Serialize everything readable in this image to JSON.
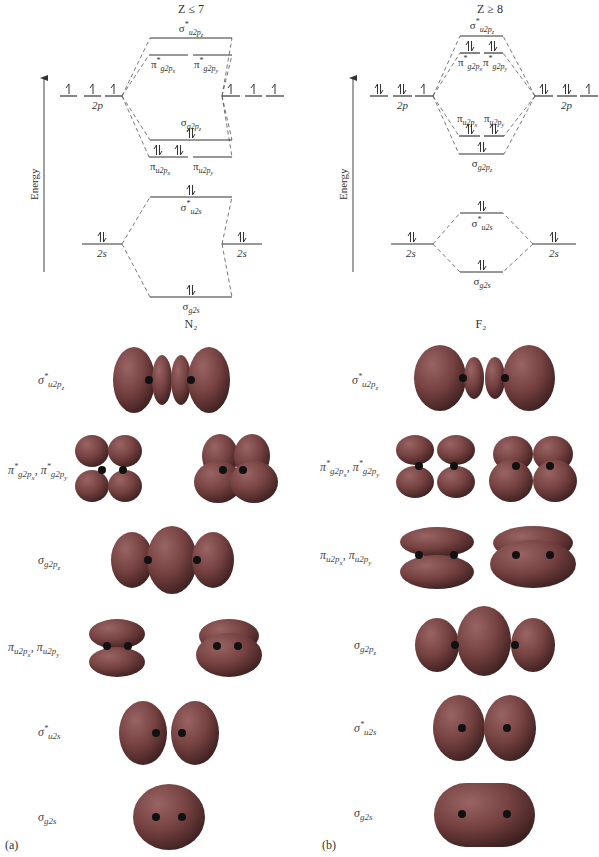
{
  "panels": [
    {
      "id": "a",
      "tag": "(a)",
      "condition": "Z ≤ 7",
      "molecule": "N₂",
      "axis_label": "Energy",
      "mo_levels": [
        {
          "name": "σ*u2pz",
          "sym": "σ",
          "star": true,
          "sub": "u2p",
          "subsub": "z",
          "electrons": 0
        },
        {
          "name": "π*g2px",
          "sym": "π",
          "star": true,
          "sub": "g2p",
          "subsub": "x",
          "electrons": 0
        },
        {
          "name": "π*g2py",
          "sym": "π",
          "star": true,
          "sub": "g2p",
          "subsub": "y",
          "electrons": 0
        },
        {
          "name": "σg2pz",
          "sym": "σ",
          "star": false,
          "sub": "g2p",
          "subsub": "z",
          "electrons": 2
        },
        {
          "name": "πu2px",
          "sym": "π",
          "star": false,
          "sub": "u2p",
          "subsub": "x",
          "electrons": 2
        },
        {
          "name": "πu2py",
          "sym": "π",
          "star": false,
          "sub": "u2p",
          "subsub": "y",
          "electrons": 2
        },
        {
          "name": "σ*u2s",
          "sym": "σ",
          "star": true,
          "sub": "u2s",
          "subsub": "",
          "electrons": 2
        },
        {
          "name": "σg2s",
          "sym": "σ",
          "star": false,
          "sub": "g2s",
          "subsub": "",
          "electrons": 2
        }
      ],
      "atomic_levels": {
        "2p_label": "2p",
        "2s_label": "2s",
        "left_2p_electrons": [
          1,
          1,
          1
        ],
        "right_2p_electrons": [
          1,
          1,
          1
        ],
        "left_2s_electrons": 2,
        "right_2s_electrons": 2
      },
      "orbital_rows": [
        {
          "label_sym": "σ",
          "label_star": "*",
          "label_sub": "u2p",
          "label_subsub": "z",
          "text": "σ*u2pz"
        },
        {
          "label_sym": "π",
          "label_star": "*",
          "label_sub": "g2p",
          "label_subsub": "x",
          "text": "π*g2px, π*g2py"
        },
        {
          "label_sym": "σ",
          "label_star": "",
          "label_sub": "g2p",
          "label_subsub": "z",
          "text": "σg2pz"
        },
        {
          "label_sym": "π",
          "label_star": "",
          "label_sub": "u2p",
          "label_subsub": "x",
          "text": "πu2px, πu2py"
        },
        {
          "label_sym": "σ",
          "label_star": "*",
          "label_sub": "u2s",
          "label_subsub": "",
          "text": "σ*u2s"
        },
        {
          "label_sym": "σ",
          "label_star": "",
          "label_sub": "g2s",
          "label_subsub": "",
          "text": "σg2s"
        }
      ]
    },
    {
      "id": "b",
      "tag": "(b)",
      "condition": "Z ≥ 8",
      "molecule": "F₂",
      "axis_label": "Energy",
      "mo_levels": [
        {
          "name": "σ*u2pz",
          "sym": "σ",
          "star": true,
          "sub": "u2p",
          "subsub": "z",
          "electrons": 0
        },
        {
          "name": "π*g2px",
          "sym": "π",
          "star": true,
          "sub": "g2p",
          "subsub": "x",
          "electrons": 2
        },
        {
          "name": "π*g2py",
          "sym": "π",
          "star": true,
          "sub": "g2p",
          "subsub": "y",
          "electrons": 2
        },
        {
          "name": "πu2px",
          "sym": "π",
          "star": false,
          "sub": "u2p",
          "subsub": "x",
          "electrons": 2
        },
        {
          "name": "πu2py",
          "sym": "π",
          "star": false,
          "sub": "u2p",
          "subsub": "y",
          "electrons": 2
        },
        {
          "name": "σg2pz",
          "sym": "σ",
          "star": false,
          "sub": "g2p",
          "subsub": "z",
          "electrons": 2
        },
        {
          "name": "σ*u2s",
          "sym": "σ",
          "star": true,
          "sub": "u2s",
          "subsub": "",
          "electrons": 2
        },
        {
          "name": "σg2s",
          "sym": "σ",
          "star": false,
          "sub": "g2s",
          "subsub": "",
          "electrons": 2
        }
      ],
      "atomic_levels": {
        "2p_label": "2p",
        "2s_label": "2s",
        "left_2p_electrons": [
          2,
          2,
          1
        ],
        "right_2p_electrons": [
          2,
          2,
          1
        ],
        "left_2s_electrons": 2,
        "right_2s_electrons": 2
      },
      "orbital_rows": [
        {
          "label_sym": "σ",
          "label_star": "*",
          "label_sub": "u2p",
          "label_subsub": "z",
          "text": "σ*u2pz"
        },
        {
          "label_sym": "π",
          "label_star": "*",
          "label_sub": "g2p",
          "label_subsub": "x",
          "text": "π*g2px, π*g2py"
        },
        {
          "label_sym": "π",
          "label_star": "",
          "label_sub": "u2p",
          "label_subsub": "x",
          "text": "πu2px, πu2py"
        },
        {
          "label_sym": "σ",
          "label_star": "",
          "label_sub": "g2p",
          "label_subsub": "z",
          "text": "σg2pz"
        },
        {
          "label_sym": "σ",
          "label_star": "*",
          "label_sub": "u2s",
          "label_subsub": "",
          "text": "σ*u2s"
        },
        {
          "label_sym": "σ",
          "label_star": "",
          "label_sub": "g2s",
          "label_subsub": "",
          "text": "σg2s"
        }
      ]
    }
  ],
  "colors": {
    "orbital_fill": "#7a4545",
    "orbital_highlight": "#9a6a6a",
    "orbital_shadow": "#3d2222",
    "nucleus": "#111111",
    "line": "#444444",
    "text": "#333333"
  }
}
